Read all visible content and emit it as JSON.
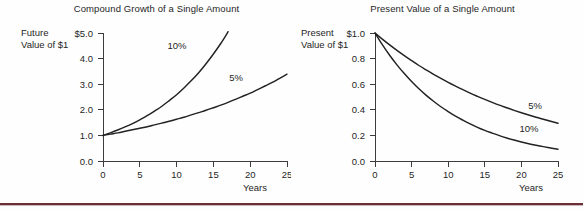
{
  "figure": {
    "background_color": "#fefefe",
    "rule_color": "#6b2f35",
    "curve_color": "#222222",
    "axis_color": "#3c3c3c"
  },
  "panels": [
    {
      "id": "compound-growth",
      "title": "Compound Growth of a Single Amount",
      "ylabel_line1": "Future",
      "ylabel_line2": "Value of $1",
      "xlabel": "Years",
      "ytick_labels": [
        "$5.0",
        "4.0",
        "3.0",
        "2.0",
        "1.0",
        "0.0"
      ],
      "xtick_labels": [
        "0",
        "5",
        "10",
        "15",
        "20",
        "25"
      ],
      "curve_labels": [
        "10%",
        "5%"
      ]
    },
    {
      "id": "present-value",
      "title": "Present Value of a Single Amount",
      "ylabel_line1": "Present",
      "ylabel_line2": "Value of $1",
      "xlabel": "Years",
      "ytick_labels": [
        "$1.0",
        "0.8",
        "0.6",
        "0.4",
        "0.2",
        "0.0"
      ],
      "xtick_labels": [
        "0",
        "5",
        "10",
        "15",
        "20",
        "25"
      ],
      "curve_labels": [
        "5%",
        "10%"
      ]
    }
  ],
  "chart_data": [
    {
      "type": "line",
      "id": "compound-growth",
      "title": "Compound Growth of a Single Amount",
      "xlabel": "Years",
      "ylabel": "Future Value of $1",
      "xlim": [
        0,
        25
      ],
      "ylim": [
        0.0,
        5.0
      ],
      "xticks": [
        0,
        5,
        10,
        15,
        20,
        25
      ],
      "yticks": [
        0.0,
        1.0,
        2.0,
        3.0,
        4.0,
        5.0
      ],
      "ytick_labels": [
        "0.0",
        "1.0",
        "2.0",
        "3.0",
        "4.0",
        "$5.0"
      ],
      "grid": false,
      "legend": "inline-annotations",
      "x": [
        0,
        1,
        2,
        3,
        4,
        5,
        6,
        7,
        8,
        9,
        10,
        11,
        12,
        13,
        14,
        15,
        16,
        17,
        18,
        19,
        20,
        21,
        22,
        23,
        24,
        25
      ],
      "series": [
        {
          "name": "10%",
          "label_position": {
            "x": 11.5,
            "y": 4.3
          },
          "clipped_at_x": 17,
          "values": [
            1.0,
            1.1,
            1.21,
            1.33,
            1.46,
            1.61,
            1.77,
            1.95,
            2.14,
            2.36,
            2.59,
            2.85,
            3.14,
            3.45,
            3.8,
            4.18,
            4.59,
            5.05
          ]
        },
        {
          "name": "5%",
          "label_position": {
            "x": 19.0,
            "y": 2.85
          },
          "values": [
            1.0,
            1.05,
            1.1,
            1.16,
            1.22,
            1.28,
            1.34,
            1.41,
            1.48,
            1.55,
            1.63,
            1.71,
            1.8,
            1.89,
            1.98,
            2.08,
            2.18,
            2.29,
            2.41,
            2.53,
            2.65,
            2.79,
            2.93,
            3.07,
            3.23,
            3.39
          ]
        }
      ]
    },
    {
      "type": "line",
      "id": "present-value",
      "title": "Present Value of a Single Amount",
      "xlabel": "Years",
      "ylabel": "Present Value of $1",
      "xlim": [
        0,
        25
      ],
      "ylim": [
        0.0,
        1.0
      ],
      "xticks": [
        0,
        5,
        10,
        15,
        20,
        25
      ],
      "yticks": [
        0.0,
        0.2,
        0.4,
        0.6,
        0.8,
        1.0
      ],
      "ytick_labels": [
        "0.0",
        "0.2",
        "0.4",
        "0.6",
        "0.8",
        "$1.0"
      ],
      "grid": false,
      "legend": "inline-annotations",
      "x": [
        0,
        1,
        2,
        3,
        4,
        5,
        6,
        7,
        8,
        9,
        10,
        11,
        12,
        13,
        14,
        15,
        16,
        17,
        18,
        19,
        20,
        21,
        22,
        23,
        24,
        25
      ],
      "series": [
        {
          "name": "5%",
          "label_position": {
            "x": 20.5,
            "y": 0.43
          },
          "values": [
            1.0,
            0.952,
            0.907,
            0.864,
            0.823,
            0.784,
            0.746,
            0.711,
            0.677,
            0.645,
            0.614,
            0.585,
            0.557,
            0.53,
            0.505,
            0.481,
            0.458,
            0.436,
            0.416,
            0.396,
            0.377,
            0.359,
            0.342,
            0.326,
            0.31,
            0.295
          ]
        },
        {
          "name": "10%",
          "label_position": {
            "x": 19.0,
            "y": 0.2
          },
          "values": [
            1.0,
            0.909,
            0.826,
            0.751,
            0.683,
            0.621,
            0.564,
            0.513,
            0.467,
            0.424,
            0.386,
            0.35,
            0.319,
            0.29,
            0.263,
            0.239,
            0.218,
            0.198,
            0.18,
            0.164,
            0.149,
            0.135,
            0.123,
            0.112,
            0.102,
            0.092
          ]
        }
      ]
    }
  ]
}
